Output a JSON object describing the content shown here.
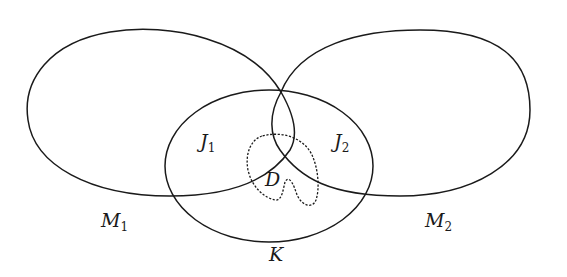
{
  "figure": {
    "labels": {
      "M1": {
        "main": "M",
        "sub": "1"
      },
      "M2": {
        "main": "M",
        "sub": "2"
      },
      "J1": {
        "main": "J",
        "sub": "1"
      },
      "J2": {
        "main": "J",
        "sub": "2"
      },
      "K": {
        "main": "K"
      },
      "D": {
        "main": "D"
      }
    },
    "regions": [
      "M1",
      "M2",
      "J1",
      "J2",
      "K",
      "D"
    ],
    "stroke_color": "#1a1a1a",
    "background": "#ffffff"
  }
}
